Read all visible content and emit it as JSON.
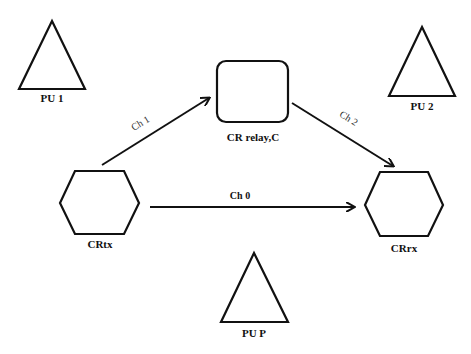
{
  "diagram": {
    "colors": {
      "stroke": "#111111",
      "background": "#ffffff",
      "text": "#111111"
    },
    "nodes": {
      "pu1": {
        "label": "PU 1",
        "shape": "triangle"
      },
      "pu2": {
        "label": "PU 2",
        "shape": "triangle"
      },
      "pup": {
        "label": "PU P",
        "shape": "triangle"
      },
      "relay": {
        "label": "CR relay,C",
        "shape": "rounded-rectangle"
      },
      "tx": {
        "label": "CRtx",
        "shape": "hexagon"
      },
      "rx": {
        "label": "CRrx",
        "shape": "hexagon"
      }
    },
    "edges": {
      "ch0": {
        "label": "Ch 0",
        "from": "CRtx",
        "to": "CRrx"
      },
      "ch1": {
        "label": "Ch 1",
        "from": "CRtx",
        "to": "CR relay,C"
      },
      "ch2": {
        "label": "Ch 2",
        "from": "CR relay,C",
        "to": "CRrx"
      }
    }
  }
}
